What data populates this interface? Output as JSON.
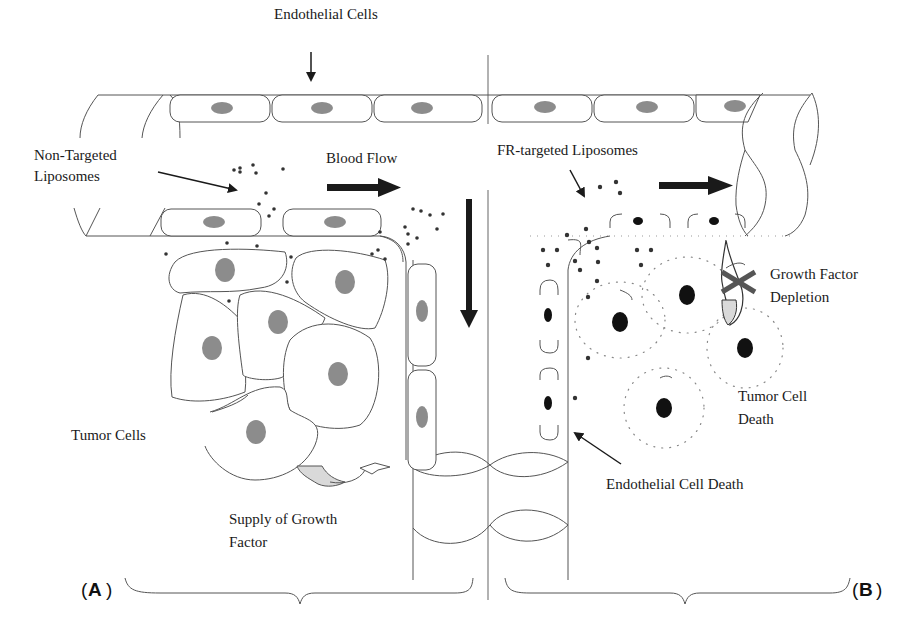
{
  "figure": {
    "type": "schematic diagram",
    "panels": [
      {
        "id": "A",
        "label": "A",
        "side": "left"
      },
      {
        "id": "B",
        "label": "B",
        "side": "right"
      }
    ]
  },
  "labels": {
    "endothelial_cells": "Endothelial Cells",
    "non_targeted_line1": "Non-Targeted",
    "non_targeted_line2": "Liposomes",
    "blood_flow": "Blood Flow",
    "fr_targeted": "FR-targeted Liposomes",
    "growth_factor_line1": "Growth Factor",
    "growth_factor_line2": "Depletion",
    "tumor_cell_death_line1": "Tumor Cell",
    "tumor_cell_death_line2": "Death",
    "tumor_cells": "Tumor Cells",
    "supply_line1": "Supply of Growth",
    "supply_line2": "Factor",
    "endothelial_cell_death": "Endothelial Cell Death",
    "panel_a_open": "(",
    "panel_a": "A",
    "panel_a_close": ")",
    "panel_b_open": "(",
    "panel_b": "B",
    "panel_b_close": ")"
  },
  "colors": {
    "line": "#555555",
    "healthy_nucleus": "#8c8c8c",
    "dead_nucleus": "#111111",
    "arrow": "#1a1a1a",
    "growth_factor_fill": "#d9d9d9"
  }
}
